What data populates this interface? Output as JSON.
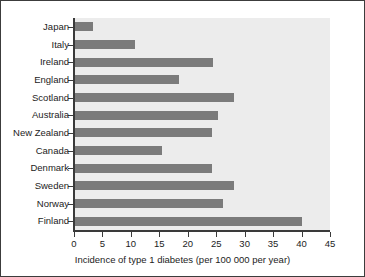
{
  "chart_data": {
    "type": "bar",
    "orientation": "horizontal",
    "title": "",
    "xlabel": "Incidence of type 1 diabetes (per 100 000 per year)",
    "ylabel": "",
    "xlim": [
      0,
      45
    ],
    "xticks": [
      0,
      5,
      10,
      15,
      20,
      25,
      30,
      35,
      40,
      45
    ],
    "xticklabels": [
      "0",
      "5",
      "10",
      "15",
      "20",
      "25",
      "30",
      "35",
      "40",
      "45"
    ],
    "grid": false,
    "legend": false,
    "categories": [
      "Japan",
      "Italy",
      "Ireland",
      "England",
      "Scotland",
      "Australia",
      "New Zealand",
      "Canada",
      "Denmark",
      "Sweden",
      "Norway",
      "Finland"
    ],
    "values": [
      3.4,
      10.8,
      24.4,
      18.5,
      28.1,
      25.3,
      24.3,
      15.4,
      24.2,
      28.1,
      26.2,
      40.0
    ],
    "bar_color": "#7b7b7b",
    "plot_background": "#ececec",
    "figure_background": "#ffffff",
    "axis_color": "#3a3a3a",
    "text_color": "#1c1c1c"
  },
  "figure": {
    "border_color": "#3c3c3c"
  }
}
